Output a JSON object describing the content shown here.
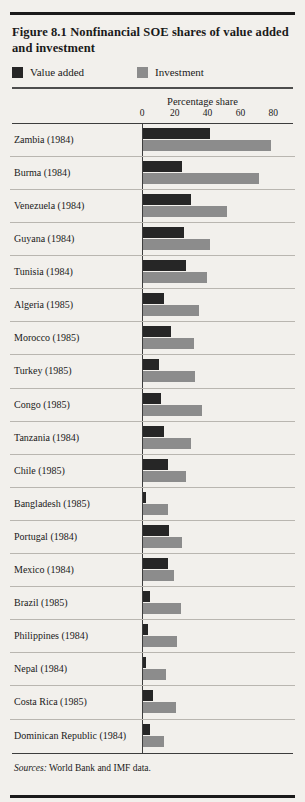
{
  "figure": {
    "title": "Figure 8.1  Nonfinancial SOE shares of value added and investment",
    "source_prefix": "Sources:",
    "source_text": " World Bank and IMF data."
  },
  "legend": {
    "items": [
      {
        "label": "Value added",
        "color": "#262626",
        "name": "value-added"
      },
      {
        "label": "Investment",
        "color": "#8c8c8c",
        "name": "investment"
      }
    ]
  },
  "chart_data": {
    "type": "bar",
    "orientation": "horizontal",
    "title": "Figure 8.1  Nonfinancial SOE shares of value added and investment",
    "xlabel": "Percentage share",
    "ylabel": "",
    "xlim": [
      0,
      80
    ],
    "xticks": [
      0,
      20,
      40,
      60,
      80
    ],
    "ticklabels": [
      "0",
      "20",
      "40",
      "60",
      "80"
    ],
    "grid": false,
    "legend_position": "top-left",
    "categories": [
      "Zambia (1984)",
      "Burma (1984)",
      "Venezuela (1984)",
      "Guyana (1984)",
      "Tunisia (1984)",
      "Algeria (1985)",
      "Morocco (1985)",
      "Turkey (1985)",
      "Congo (1985)",
      "Tanzania (1984)",
      "Chile (1985)",
      "Bangladesh (1985)",
      "Portugal (1984)",
      "Mexico (1984)",
      "Brazil (1985)",
      "Philippines (1984)",
      "Nepal (1984)",
      "Costa Rica (1985)",
      "Dominican Republic (1984)"
    ],
    "series": [
      {
        "name": "Value added",
        "color": "#262626",
        "values": [
          41,
          24,
          29,
          25,
          26,
          13,
          17,
          10,
          11,
          13,
          15,
          2,
          16,
          15,
          4,
          3,
          2,
          6,
          4
        ]
      },
      {
        "name": "Investment",
        "color": "#8c8c8c",
        "values": [
          78,
          71,
          51,
          41,
          39,
          34,
          31,
          32,
          36,
          29,
          26,
          15,
          24,
          19,
          23,
          21,
          14,
          20,
          13
        ]
      }
    ]
  }
}
